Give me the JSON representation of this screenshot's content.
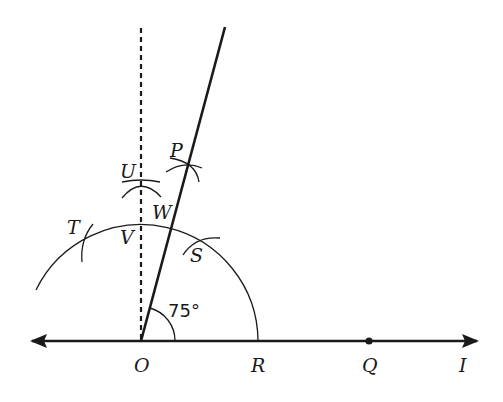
{
  "diagram": {
    "angle_label": "75°",
    "points": {
      "O": "O",
      "R": "R",
      "Q": "Q",
      "I": "I",
      "T": "T",
      "V": "V",
      "W": "W",
      "S": "S",
      "U": "U",
      "P": "P"
    },
    "elements": [
      {
        "type": "line",
        "name": "line I",
        "through": [
          "O",
          "R",
          "Q"
        ],
        "arrows": "both"
      },
      {
        "type": "ray",
        "name": "ray OP",
        "angle_with_line_deg": 75,
        "style": "solid"
      },
      {
        "type": "line",
        "name": "perpendicular at O",
        "through": [
          "O",
          "V",
          "U"
        ],
        "style": "dashed"
      },
      {
        "type": "arc",
        "name": "construction arc",
        "center": "O",
        "through": [
          "R",
          "S",
          "V",
          "T"
        ]
      },
      {
        "type": "arc_mark",
        "at": [
          "T",
          "S",
          "U",
          "P"
        ]
      },
      {
        "type": "point",
        "name": "Q",
        "marker": "dot"
      }
    ],
    "colors": {
      "ink": "#1a1a1a",
      "background": "#ffffff"
    }
  }
}
